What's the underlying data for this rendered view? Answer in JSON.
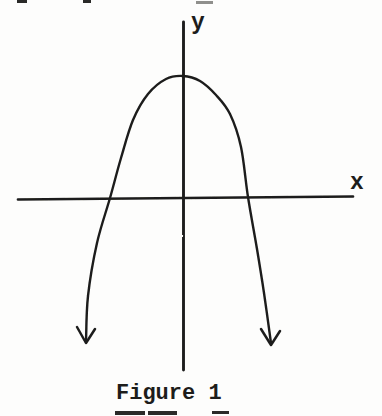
{
  "figure": {
    "caption": "Figure 1",
    "paper_color": "#fdfdfc",
    "ink_color": "#1d1d1b"
  },
  "chart_data": {
    "type": "line",
    "title": "Figure 1",
    "xlabel": "x",
    "ylabel": "y",
    "axes_unlabeled": true,
    "grid": false,
    "legend": false,
    "axes_px": {
      "x_axis": [
        18,
        199.5,
        353,
        196.5
      ],
      "y_axis": [
        183.5,
        22,
        183.5,
        370
      ]
    },
    "curve_points_px": [
      [
        86,
        342
      ],
      [
        88,
        296
      ],
      [
        97,
        243
      ],
      [
        110,
        198
      ],
      [
        121,
        158
      ],
      [
        133,
        120
      ],
      [
        148,
        94
      ],
      [
        166,
        79
      ],
      [
        183,
        76
      ],
      [
        200,
        81
      ],
      [
        216,
        95
      ],
      [
        230,
        114
      ],
      [
        241,
        147
      ],
      [
        248,
        197
      ],
      [
        257,
        249
      ],
      [
        264,
        293
      ],
      [
        271,
        343
      ]
    ],
    "arrowheads_px": [
      {
        "tip": [
          86,
          343
        ],
        "left_wing": [
          77,
          327
        ],
        "right_wing": [
          95,
          329
        ]
      },
      {
        "tip": [
          271,
          345
        ],
        "left_wing": [
          261,
          329
        ],
        "right_wing": [
          280,
          331
        ]
      }
    ],
    "vertex_px": [
      183,
      76
    ],
    "x_intercepts_px": [
      110,
      248
    ],
    "ink_color": "#1d1d1b"
  }
}
